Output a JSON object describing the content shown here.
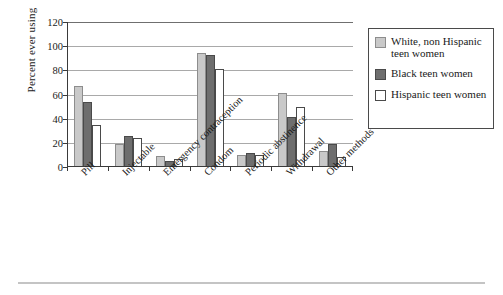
{
  "chart_data": {
    "type": "bar",
    "title": "",
    "xlabel": "",
    "ylabel": "Percent ever using",
    "ylim": [
      0,
      120
    ],
    "yticks": [
      0,
      20,
      40,
      60,
      80,
      100,
      120
    ],
    "grid": true,
    "legend_position": "right",
    "categories": [
      "Pill",
      "Injectable",
      "Emergency contraception",
      "Condom",
      "Periodic abstinence",
      "Withdrawal",
      "Other methods"
    ],
    "series": [
      {
        "name": "White, non Hispanic teen women",
        "color": "#c9c9c9",
        "values": [
          67,
          19,
          9,
          94,
          10,
          61,
          13
        ]
      },
      {
        "name": "Black teen women",
        "color": "#6e6e6e",
        "values": [
          54,
          26,
          5,
          93,
          12,
          41,
          19
        ]
      },
      {
        "name": "Hispanic teen women",
        "color": "#ffffff",
        "values": [
          35,
          24,
          7,
          81,
          10,
          50,
          8
        ]
      }
    ]
  },
  "legend": {
    "entries": [
      "White, non Hispanic teen women",
      "Black teen women",
      "Hispanic teen women"
    ]
  }
}
